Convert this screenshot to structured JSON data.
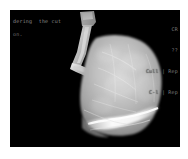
{
  "window": {
    "background_color": "#ffffff",
    "canvas_color": "#000000"
  },
  "viewport": {
    "name": "volume-render-viewport",
    "width_px": 170,
    "height_px": 137
  },
  "overlay": {
    "status_line": "dering  the cut",
    "status_sub": "on.",
    "text_color": "#8d8d8d"
  },
  "hud_right": {
    "line1": "CR",
    "line2": "??",
    "line3": "Cull | Rep",
    "line4": "C-l | Rep",
    "text_color": "#7e7e7e"
  },
  "scene": {
    "title": "sagittal lung volume rendering",
    "structures": [
      {
        "name": "airway-tube",
        "label": "bronchus / trachea cast",
        "brightness": "high",
        "color": "#d8d8d8"
      },
      {
        "name": "lung-body",
        "label": "lung parenchyma",
        "brightness": "medium",
        "color": "#b9b9b9"
      },
      {
        "name": "fissure-highlight",
        "label": "bright diagonal fissure band",
        "brightness": "very-high",
        "color": "#f2f2f2"
      }
    ]
  }
}
